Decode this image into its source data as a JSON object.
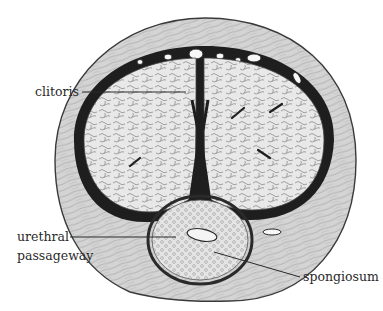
{
  "figure": {
    "type": "histological cross-section illustration",
    "colors": {
      "background": "#ffffff",
      "outer_tissue": "#d6d6d6",
      "outer_tissue_stroke": "#3a3a3a",
      "capsule_dark": "#1e1e1e",
      "erectile_tissue": "#e6e6e6",
      "erectile_texture": "#8c8c8c",
      "spongiosum_fill": "#e2e2e2",
      "urethra_fill": "#f4f4f4",
      "leader_line": "#2a2a2a",
      "label_text": "#2a2a2a"
    }
  },
  "labels": {
    "clitoris": "clitoris",
    "urethral_line1": "urethral",
    "urethral_line2": "passageway",
    "spongiosum": "spongiosum"
  }
}
